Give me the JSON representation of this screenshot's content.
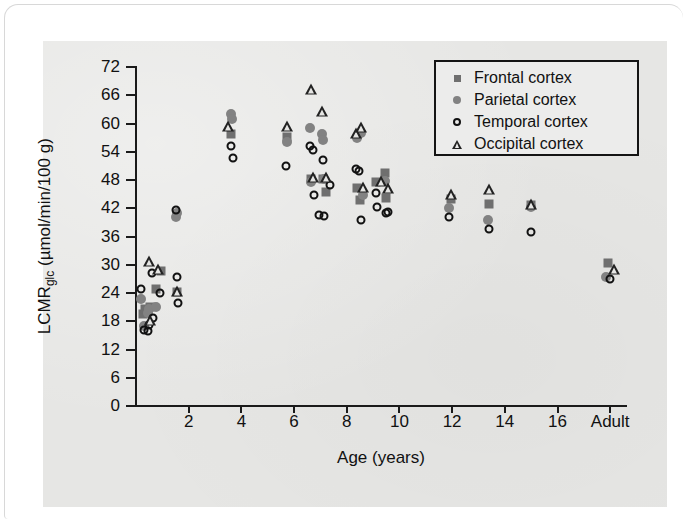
{
  "figure": {
    "background_color": "#e6e6e4",
    "card_color": "#ffffff"
  },
  "chart_data": {
    "type": "scatter",
    "title": "",
    "xlabel": "Age (years)",
    "ylabel": "LCMRglc (µmol/min/100 g)",
    "ylabel_main": "LCMR",
    "ylabel_sub": "glc",
    "ylabel_units": " (µmol/min/100 g)",
    "xlim": [
      0,
      18.6
    ],
    "ylim": [
      0,
      72
    ],
    "grid": false,
    "legend_position": "top-right",
    "xticks": [
      2,
      4,
      6,
      8,
      10,
      12,
      14,
      16,
      18
    ],
    "xtick_labels": [
      "2",
      "4",
      "6",
      "8",
      "10",
      "12",
      "14",
      "16",
      "Adult"
    ],
    "yticks": [
      0,
      6,
      12,
      18,
      24,
      30,
      36,
      42,
      48,
      54,
      60,
      66,
      72
    ],
    "ytick_labels": [
      "0",
      "6",
      "12",
      "18",
      "24",
      "30",
      "36",
      "42",
      "48",
      "54",
      "60",
      "66",
      "72"
    ],
    "series": [
      {
        "name": "Frontal cortex",
        "marker": "filled-square",
        "color": "#6f6f6f",
        "points": [
          [
            0.25,
            19.5
          ],
          [
            0.35,
            20.5
          ],
          [
            0.55,
            21.0
          ],
          [
            0.75,
            24.8
          ],
          [
            0.95,
            28.6
          ],
          [
            1.55,
            24.2
          ],
          [
            3.6,
            57.8
          ],
          [
            5.75,
            57.2
          ],
          [
            6.65,
            48.2
          ],
          [
            7.1,
            48.3
          ],
          [
            7.2,
            45.5
          ],
          [
            8.4,
            46.2
          ],
          [
            8.5,
            43.8
          ],
          [
            9.1,
            47.5
          ],
          [
            9.45,
            49.5
          ],
          [
            9.5,
            44.2
          ],
          [
            11.95,
            44.0
          ],
          [
            13.4,
            42.8
          ],
          [
            15.0,
            42.6
          ],
          [
            17.9,
            30.4
          ]
        ]
      },
      {
        "name": "Parietal cortex",
        "marker": "filled-circle",
        "color": "#828282",
        "points": [
          [
            0.2,
            22.8
          ],
          [
            0.3,
            17.0
          ],
          [
            0.45,
            19.8
          ],
          [
            0.5,
            20.6
          ],
          [
            0.75,
            21.0
          ],
          [
            1.5,
            40.2
          ],
          [
            1.55,
            41.0
          ],
          [
            3.6,
            62.0
          ],
          [
            3.65,
            61.0
          ],
          [
            5.75,
            56.0
          ],
          [
            6.6,
            59.0
          ],
          [
            6.65,
            47.5
          ],
          [
            7.05,
            57.8
          ],
          [
            7.1,
            56.6
          ],
          [
            7.15,
            48.2
          ],
          [
            8.4,
            57.0
          ],
          [
            8.55,
            58.0
          ],
          [
            8.6,
            44.8
          ],
          [
            9.45,
            47.8
          ],
          [
            11.9,
            42.0
          ],
          [
            13.35,
            39.5
          ],
          [
            15.0,
            42.2
          ],
          [
            17.85,
            27.4
          ]
        ]
      },
      {
        "name": "Temporal cortex",
        "marker": "open-circle",
        "color": "#111111",
        "points": [
          [
            0.2,
            24.8
          ],
          [
            0.3,
            16.2
          ],
          [
            0.45,
            16.0
          ],
          [
            0.5,
            17.2
          ],
          [
            0.6,
            28.2
          ],
          [
            0.65,
            18.6
          ],
          [
            0.9,
            24.0
          ],
          [
            1.5,
            41.6
          ],
          [
            1.55,
            27.4
          ],
          [
            1.6,
            21.8
          ],
          [
            3.6,
            55.2
          ],
          [
            3.7,
            52.6
          ],
          [
            5.7,
            51.0
          ],
          [
            6.6,
            55.2
          ],
          [
            6.7,
            54.4
          ],
          [
            6.75,
            44.8
          ],
          [
            6.95,
            40.6
          ],
          [
            7.1,
            52.2
          ],
          [
            7.15,
            40.4
          ],
          [
            7.35,
            47.0
          ],
          [
            8.35,
            50.4
          ],
          [
            8.45,
            50.0
          ],
          [
            8.55,
            39.4
          ],
          [
            9.1,
            45.2
          ],
          [
            9.15,
            42.2
          ],
          [
            9.5,
            41.0
          ],
          [
            9.55,
            41.2
          ],
          [
            11.9,
            40.2
          ],
          [
            13.4,
            37.5
          ],
          [
            15.0,
            37.0
          ],
          [
            18.0,
            27.0
          ]
        ]
      },
      {
        "name": "Occipital cortex",
        "marker": "open-triangle",
        "color": "#222222",
        "points": [
          [
            0.5,
            30.8
          ],
          [
            0.55,
            18.2
          ],
          [
            0.85,
            29.2
          ],
          [
            1.55,
            24.4
          ],
          [
            3.5,
            59.4
          ],
          [
            5.75,
            59.4
          ],
          [
            6.65,
            67.4
          ],
          [
            6.7,
            48.6
          ],
          [
            7.05,
            62.6
          ],
          [
            7.2,
            48.6
          ],
          [
            8.35,
            58.0
          ],
          [
            8.55,
            59.2
          ],
          [
            8.6,
            46.6
          ],
          [
            9.3,
            47.8
          ],
          [
            9.55,
            46.2
          ],
          [
            11.95,
            45.0
          ],
          [
            13.4,
            46.0
          ],
          [
            15.0,
            43.0
          ],
          [
            18.15,
            29.2
          ]
        ]
      }
    ]
  },
  "legend": {
    "items": [
      {
        "label": "Frontal cortex",
        "marker": "filled-square"
      },
      {
        "label": "Parietal cortex",
        "marker": "filled-circle"
      },
      {
        "label": "Temporal cortex",
        "marker": "open-circle"
      },
      {
        "label": "Occipital cortex",
        "marker": "open-triangle"
      }
    ]
  }
}
